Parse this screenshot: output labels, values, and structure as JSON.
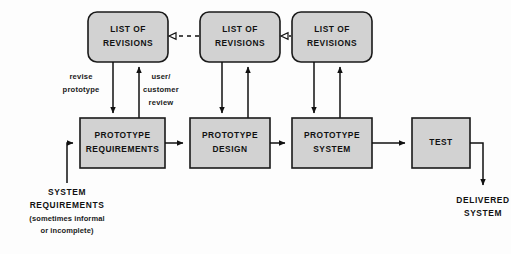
{
  "diagram": {
    "colors": {
      "node_fill": "#d2d2d2",
      "node_stroke": "#1a1a1a",
      "arrow": "#111111",
      "text": "#111111",
      "background": "#fdfdfd"
    },
    "revision_nodes": [
      {
        "id": "revisions-1",
        "line1": "LIST OF",
        "line2": "REVISIONS"
      },
      {
        "id": "revisions-2",
        "line1": "LIST OF",
        "line2": "REVISIONS"
      },
      {
        "id": "revisions-3",
        "line1": "LIST OF",
        "line2": "REVISIONS"
      }
    ],
    "process_nodes": [
      {
        "id": "prototype-requirements",
        "line1": "PROTOTYPE",
        "line2": "REQUIREMENTS"
      },
      {
        "id": "prototype-design",
        "line1": "PROTOTYPE",
        "line2": "DESIGN"
      },
      {
        "id": "prototype-system",
        "line1": "PROTOTYPE",
        "line2": "SYSTEM"
      },
      {
        "id": "test",
        "line1": "TEST",
        "line2": ""
      }
    ],
    "edge_labels": {
      "revise_line1": "revise",
      "revise_line2": "prototype",
      "review_line1": "user/",
      "review_line2": "customer",
      "review_line3": "review"
    },
    "input_annotation": {
      "line1": "SYSTEM",
      "line2": "REQUIREMENTS",
      "line3": "(sometimes informal",
      "line4": "or incomplete)"
    },
    "output_annotation": {
      "line1": "DELIVERED",
      "line2": "SYSTEM"
    }
  }
}
